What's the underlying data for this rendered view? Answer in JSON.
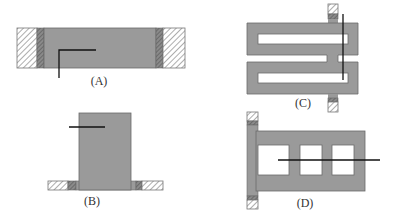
{
  "diagram": {
    "colors": {
      "body_fill": "#9a9a9a",
      "body_stroke": "#6a6a6a",
      "dark_strip": "#6e6e6e",
      "hatch_line": "#8a8a8a",
      "hatch_bg": "#ffffff",
      "line": "#111111",
      "label": "#333333"
    },
    "panels": [
      {
        "id": "A",
        "label": "(A)",
        "description": "Horizontal bar clamped between hatched supports at both ends with an L-shaped line"
      },
      {
        "id": "B",
        "label": "(B)",
        "description": "Vertical block on a flange with hatched supports on each side and a horizontal line"
      },
      {
        "id": "C",
        "label": "(C)",
        "description": "Serpentine (meander) structure with two slots, anchored top and bottom by hatched tabs, with a vertical line"
      },
      {
        "id": "D",
        "label": "(D)",
        "description": "Frame with three rectangular windows attached to a vertical anchored strip, with a horizontal line through the windows"
      }
    ]
  }
}
